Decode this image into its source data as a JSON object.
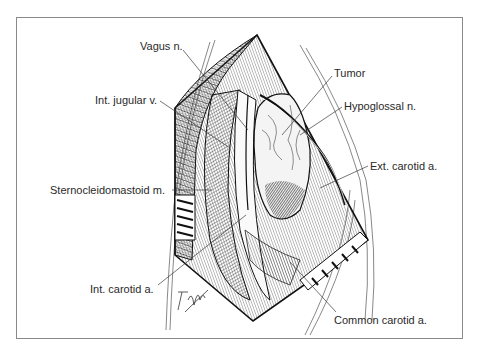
{
  "figure": {
    "type": "surgical illustration"
  },
  "labels": {
    "vagus": "Vagus n.",
    "int_jugular": "Int. jugular v.",
    "sternocleidomastoid": "Sternocleidomastoid m.",
    "int_carotid": "Int. carotid a.",
    "tumor": "Tumor",
    "hypoglossal": "Hypoglossal n.",
    "ext_carotid": "Ext. carotid a.",
    "common_carotid": "Common carotid a."
  },
  "signature": "T. Hoga",
  "colors": {
    "frame": "#8a8a8a",
    "ink": "#1a1a1a",
    "text": "#2a2a2a",
    "background": "#ffffff"
  }
}
